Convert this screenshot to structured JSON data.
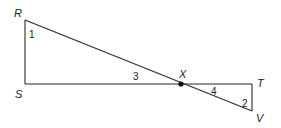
{
  "diagram": {
    "type": "geometry",
    "points": {
      "R": {
        "label": "R",
        "x": 25,
        "y": 20
      },
      "S": {
        "label": "S",
        "x": 25,
        "y": 84
      },
      "X": {
        "label": "X",
        "x": 181,
        "y": 84
      },
      "T": {
        "label": "T",
        "x": 252,
        "y": 84
      },
      "V": {
        "label": "V",
        "x": 252,
        "y": 111
      }
    },
    "segments": [
      [
        "R",
        "S"
      ],
      [
        "S",
        "T"
      ],
      [
        "R",
        "V"
      ],
      [
        "T",
        "V"
      ]
    ],
    "angles": [
      {
        "label": "1",
        "at": "R"
      },
      {
        "label": "2",
        "at": "V"
      },
      {
        "label": "3",
        "at": "X",
        "between": [
          "S",
          "R"
        ]
      },
      {
        "label": "4",
        "at": "X",
        "between": [
          "T",
          "V"
        ]
      }
    ],
    "labels": {
      "R": "R",
      "S": "S",
      "X": "X",
      "T": "T",
      "V": "V",
      "angle1": "1",
      "angle2": "2",
      "angle3": "3",
      "angle4": "4"
    }
  }
}
